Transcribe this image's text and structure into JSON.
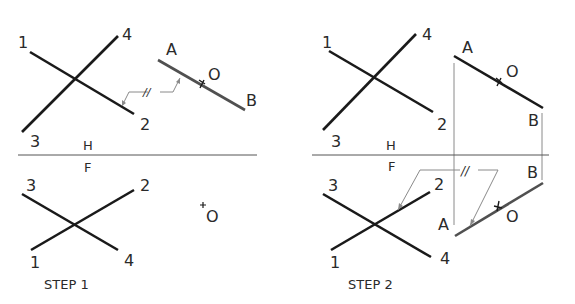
{
  "figure": {
    "steps": [
      {
        "caption": "STEP 1",
        "top_view": {
          "line_12": {
            "p1_label": "1",
            "p2_label": "2"
          },
          "line_34": {
            "p3_label": "3",
            "p4_label": "4"
          },
          "line_AB": {
            "a_label": "A",
            "b_label": "B"
          },
          "point_O_label": "O",
          "parallel_mark": "//"
        },
        "fold_line": {
          "above_label": "H",
          "below_label": "F"
        },
        "front_view": {
          "labels": {
            "p1": "1",
            "p2": "2",
            "p3": "3",
            "p4": "4"
          },
          "point_O_label": "O"
        }
      },
      {
        "caption": "STEP 2",
        "top_view": {
          "labels": {
            "p1": "1",
            "p2": "2",
            "p3": "3",
            "p4": "4",
            "a": "A",
            "b": "B"
          },
          "point_O_label": "O"
        },
        "fold_line": {
          "above_label": "H",
          "below_label": "F"
        },
        "front_view": {
          "labels": {
            "p1": "1",
            "p2": "2",
            "p3": "3",
            "p4": "4",
            "a": "A",
            "b": "B"
          },
          "point_O_label": "O",
          "parallel_mark": "//"
        }
      }
    ],
    "colors": {
      "line": "#1a1a1a",
      "ab_line": "#505050",
      "thin": "#8a8a8a",
      "text": "#2a2a2a"
    }
  }
}
